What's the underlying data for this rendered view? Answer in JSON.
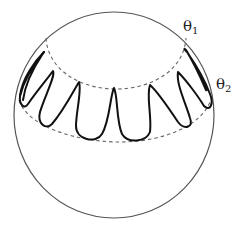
{
  "figure": {
    "type": "sphere-latitude-band-diagram",
    "labels": {
      "theta1": {
        "symbol": "θ",
        "subscript": "1"
      },
      "theta2": {
        "symbol": "θ",
        "subscript": "2"
      }
    },
    "elements": {
      "sphere_outline": "solid circle",
      "upper_latitude": "dashed circle at θ1",
      "lower_latitude": "dashed circle at θ2",
      "curve": "closed oscillating curve confined between θ1 and θ2"
    },
    "lobe_count_visible": 7
  }
}
